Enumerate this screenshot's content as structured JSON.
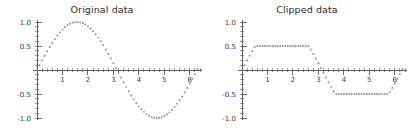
{
  "figure": {
    "width": 409,
    "height": 140,
    "background": "#ffffff",
    "dot_color": "#8c8c8c",
    "axis_color": "#4a4a4a",
    "text_color": "#2b2b2b"
  },
  "panels": [
    {
      "key": "original",
      "title": "Original data",
      "name": "original-data-plot"
    },
    {
      "key": "clipped",
      "title": "Clipped data",
      "name": "clipped-data-plot"
    }
  ],
  "chart_data": [
    {
      "type": "scatter",
      "title": "Original data",
      "xlabel": "",
      "ylabel": "",
      "xlim": [
        0,
        6.4
      ],
      "ylim": [
        -1.0,
        1.0
      ],
      "grid": false,
      "legend": null,
      "xticks": [
        1,
        2,
        3,
        4,
        5,
        6
      ],
      "xticklabels": [
        "1",
        "2",
        "3",
        "4",
        "5",
        "6"
      ],
      "yticks": [
        -1.0,
        -0.5,
        0.5,
        1.0
      ],
      "yticklabels": [
        "-1.0",
        "-0.5",
        "0.5",
        "1.0"
      ],
      "marker": "dotted",
      "series": [
        {
          "name": "sin(x)",
          "x": [
            0.0,
            0.1,
            0.2,
            0.3,
            0.4,
            0.5,
            0.6,
            0.7,
            0.8,
            0.9,
            1.0,
            1.1,
            1.2,
            1.3,
            1.4,
            1.5,
            1.6,
            1.7,
            1.8,
            1.9,
            2.0,
            2.1,
            2.2,
            2.3,
            2.4,
            2.5,
            2.6,
            2.7,
            2.8,
            2.9,
            3.0,
            3.1,
            3.2,
            3.3,
            3.4,
            3.5,
            3.6,
            3.7,
            3.8,
            3.9,
            4.0,
            4.1,
            4.2,
            4.3,
            4.4,
            4.5,
            4.6,
            4.7,
            4.8,
            4.9,
            5.0,
            5.1,
            5.2,
            5.3,
            5.4,
            5.5,
            5.6,
            5.7,
            5.8,
            5.9,
            6.0,
            6.1,
            6.2,
            6.3
          ],
          "y": [
            0.0,
            0.0998,
            0.1987,
            0.2955,
            0.3894,
            0.4794,
            0.5646,
            0.6442,
            0.7174,
            0.7833,
            0.8415,
            0.8912,
            0.932,
            0.9636,
            0.9854,
            0.9975,
            0.9996,
            0.9917,
            0.9738,
            0.9463,
            0.9093,
            0.8632,
            0.8085,
            0.7457,
            0.6755,
            0.5985,
            0.5155,
            0.4274,
            0.335,
            0.2392,
            0.1411,
            0.0416,
            -0.0584,
            -0.1577,
            -0.2555,
            -0.3508,
            -0.4425,
            -0.5298,
            -0.6119,
            -0.6878,
            -0.7568,
            -0.8183,
            -0.8716,
            -0.9162,
            -0.9516,
            -0.9775,
            -0.9937,
            -0.9999,
            -0.9962,
            -0.9825,
            -0.9589,
            -0.9258,
            -0.8835,
            -0.8323,
            -0.7728,
            -0.7055,
            -0.6313,
            -0.5507,
            -0.4646,
            -0.3739,
            -0.2794,
            -0.1822,
            -0.0831,
            0.0168
          ]
        }
      ]
    },
    {
      "type": "scatter",
      "title": "Clipped data",
      "xlabel": "",
      "ylabel": "",
      "xlim": [
        0,
        6.4
      ],
      "ylim": [
        -1.0,
        1.0
      ],
      "grid": false,
      "legend": null,
      "xticks": [
        1,
        2,
        3,
        4,
        5,
        6
      ],
      "xticklabels": [
        "1",
        "2",
        "3",
        "4",
        "5",
        "6"
      ],
      "yticks": [
        -1.0,
        -0.5,
        0.5,
        1.0
      ],
      "yticklabels": [
        "-1.0",
        "-0.5",
        "0.5",
        "1.0"
      ],
      "marker": "dotted",
      "clip_limits": [
        -0.5,
        0.5
      ],
      "series": [
        {
          "name": "clip(sin(x), -0.5, 0.5)",
          "x": [
            0.0,
            0.1,
            0.2,
            0.3,
            0.4,
            0.5,
            0.6,
            0.7,
            0.8,
            0.9,
            1.0,
            1.1,
            1.2,
            1.3,
            1.4,
            1.5,
            1.6,
            1.7,
            1.8,
            1.9,
            2.0,
            2.1,
            2.2,
            2.3,
            2.4,
            2.5,
            2.6,
            2.7,
            2.8,
            2.9,
            3.0,
            3.1,
            3.2,
            3.3,
            3.4,
            3.5,
            3.6,
            3.7,
            3.8,
            3.9,
            4.0,
            4.1,
            4.2,
            4.3,
            4.4,
            4.5,
            4.6,
            4.7,
            4.8,
            4.9,
            5.0,
            5.1,
            5.2,
            5.3,
            5.4,
            5.5,
            5.6,
            5.7,
            5.8,
            5.9,
            6.0,
            6.1,
            6.2,
            6.3
          ],
          "y": [
            0.0,
            0.0998,
            0.1987,
            0.2955,
            0.3894,
            0.4794,
            0.5,
            0.5,
            0.5,
            0.5,
            0.5,
            0.5,
            0.5,
            0.5,
            0.5,
            0.5,
            0.5,
            0.5,
            0.5,
            0.5,
            0.5,
            0.5,
            0.5,
            0.5,
            0.5,
            0.5,
            0.5,
            0.4274,
            0.335,
            0.2392,
            0.1411,
            0.0416,
            -0.0584,
            -0.1577,
            -0.2555,
            -0.3508,
            -0.4425,
            -0.5,
            -0.5,
            -0.5,
            -0.5,
            -0.5,
            -0.5,
            -0.5,
            -0.5,
            -0.5,
            -0.5,
            -0.5,
            -0.5,
            -0.5,
            -0.5,
            -0.5,
            -0.5,
            -0.5,
            -0.5,
            -0.5,
            -0.5,
            -0.5,
            -0.4646,
            -0.3739,
            -0.2794,
            -0.1822,
            -0.0831,
            0.0168
          ]
        }
      ]
    }
  ]
}
